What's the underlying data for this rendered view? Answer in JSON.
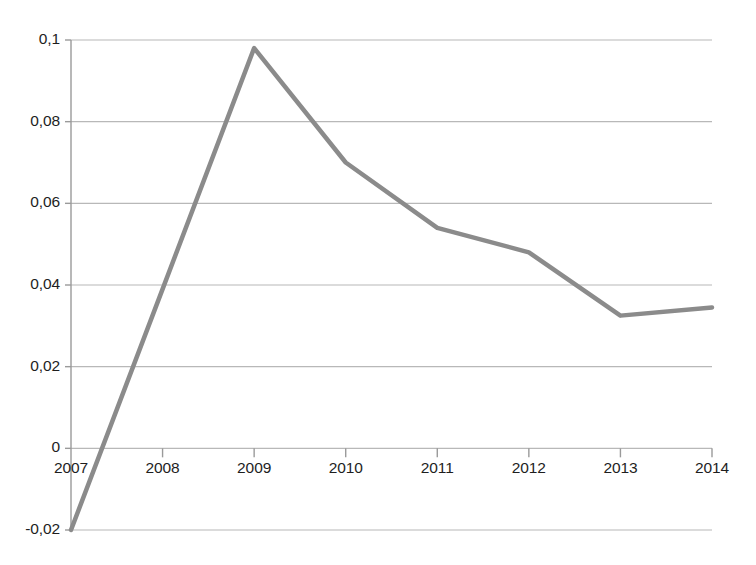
{
  "chart_data": {
    "type": "line",
    "title": "",
    "subtitle": "",
    "xlabel": "",
    "ylabel": "",
    "categories": [
      "2007",
      "2008",
      "2009",
      "2010",
      "2011",
      "2012",
      "2013",
      "2014"
    ],
    "x": [
      2007,
      2008,
      2009,
      2010,
      2011,
      2012,
      2013,
      2014
    ],
    "values": [
      -0.02,
      0.039,
      0.098,
      0.07,
      0.054,
      0.048,
      0.0325,
      0.0345
    ],
    "series": [
      {
        "name": "",
        "values": [
          -0.02,
          0.039,
          0.098,
          0.07,
          0.054,
          0.048,
          0.0325,
          0.0345
        ]
      }
    ],
    "ylim": [
      -0.02,
      0.1
    ],
    "xlim": [
      2007,
      2014
    ],
    "ytick_labels": [
      "0,1",
      "0,08",
      "0,06",
      "0,04",
      "0,02",
      "0",
      "-0,02"
    ],
    "ytick_values": [
      0.1,
      0.08,
      0.06,
      0.04,
      0.02,
      0,
      -0.02
    ],
    "xtick_labels": [
      "2007",
      "2008",
      "2009",
      "2010",
      "2011",
      "2012",
      "2013",
      "2014"
    ],
    "grid": "horizontal",
    "legend": "none",
    "decimal_separator": ",",
    "annotations": []
  },
  "style": {
    "line_color": "#8b8b8b",
    "grid_color": "#b8b8b8",
    "axis_color": "#9a9a9a",
    "text_color": "#1e1e1e",
    "background": "#ffffff",
    "line_width": 4.5
  }
}
